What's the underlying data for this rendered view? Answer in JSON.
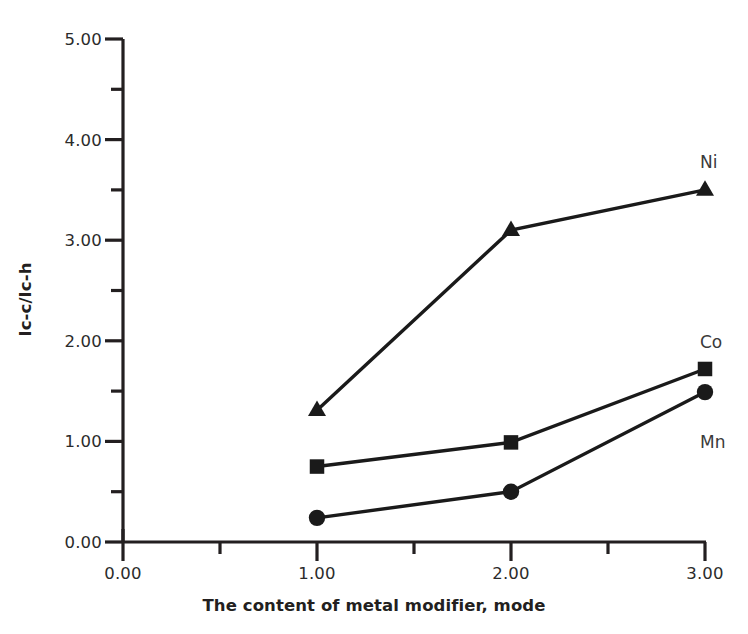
{
  "chart_data": {
    "type": "line",
    "title": "",
    "xlabel": "The content of metal modifier, mode",
    "ylabel": "Ic-c/Ic-h",
    "xlim": [
      0.0,
      3.0
    ],
    "ylim": [
      0.0,
      5.0
    ],
    "x": [
      1.0,
      2.0,
      3.0
    ],
    "grid": false,
    "legend_position": "inline-right",
    "xticks": [
      "0.00",
      "1.00",
      "2.00",
      "3.00"
    ],
    "xtick_values": [
      0.0,
      1.0,
      2.0,
      3.0
    ],
    "xminor_tick_values": [
      0.5,
      1.5,
      2.5
    ],
    "yticks": [
      "0.00",
      "1.00",
      "2.00",
      "3.00",
      "4.00",
      "5.00"
    ],
    "ytick_values": [
      0.0,
      1.0,
      2.0,
      3.0,
      4.0,
      5.0
    ],
    "yminor_tick_values": [
      0.5,
      1.5,
      2.5,
      3.5,
      4.5
    ],
    "series": [
      {
        "name": "Ni",
        "marker": "triangle",
        "color": "#1a1a1a",
        "x": [
          1.0,
          2.0,
          3.0
        ],
        "values": [
          1.31,
          3.1,
          3.5
        ]
      },
      {
        "name": "Co",
        "marker": "square",
        "color": "#1a1a1a",
        "x": [
          1.0,
          2.0,
          3.0
        ],
        "values": [
          0.75,
          0.99,
          1.72
        ]
      },
      {
        "name": "Mn",
        "marker": "circle",
        "color": "#1a1a1a",
        "x": [
          1.0,
          2.0,
          3.0
        ],
        "values": [
          0.24,
          0.5,
          1.49
        ]
      }
    ],
    "annotations": [
      {
        "text": "Ni",
        "series": "Ni",
        "x_px": 700,
        "y_px": 152
      },
      {
        "text": "Co",
        "series": "Co",
        "x_px": 700,
        "y_px": 332
      },
      {
        "text": "Mn",
        "series": "Mn",
        "x_px": 700,
        "y_px": 432
      }
    ]
  },
  "colors": {
    "axis": "#231f20",
    "ink": "#1a1a1a",
    "background": "#ffffff",
    "tick_text": "#2b2b2b"
  }
}
